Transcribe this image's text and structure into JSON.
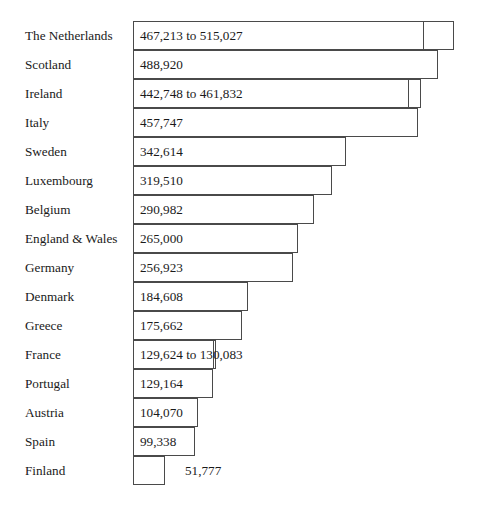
{
  "chart_data": {
    "type": "bar",
    "title": "",
    "subtitle": "",
    "xlabel": "",
    "ylabel": "",
    "orientation": "horizontal",
    "grid": false,
    "legend": null,
    "axis_visible": false,
    "xlim": [
      0,
      515027
    ],
    "categories": [
      "The Netherlands",
      "Scotland",
      "Ireland",
      "Italy",
      "Sweden",
      "Luxembourg",
      "Belgium",
      "England & Wales",
      "Germany",
      "Denmark",
      "Greece",
      "France",
      "Portugal",
      "Austria",
      "Spain",
      "Finland"
    ],
    "values": [
      467213,
      488920,
      442748,
      457747,
      342614,
      319510,
      290982,
      265000,
      256923,
      184608,
      175662,
      129624,
      129164,
      104070,
      99338,
      51777
    ],
    "value_upper": [
      515027,
      null,
      461832,
      null,
      null,
      null,
      null,
      null,
      null,
      null,
      null,
      130083,
      null,
      null,
      null,
      null
    ],
    "data_labels": [
      "467,213 to 515,027",
      "488,920",
      "442,748 to 461,832",
      "457,747",
      "342,614",
      "319,510",
      "290,982",
      "265,000",
      "256,923",
      "184,608",
      "175,662",
      "129,624 to 130,083",
      "129,164",
      "104,070",
      "99,338",
      "51,777"
    ],
    "label_placement": [
      "inside",
      "inside",
      "inside",
      "inside",
      "inside",
      "inside",
      "inside",
      "inside",
      "inside",
      "inside",
      "inside",
      "inside",
      "inside",
      "inside",
      "inside",
      "outside"
    ],
    "colors": {
      "bar_fill": "#ffffff",
      "bar_border": "#4a4a4a",
      "text": "#1a1a1a",
      "background": "#ffffff"
    }
  },
  "layout": {
    "bar_origin_x": 133,
    "row_height": 29,
    "first_row_top": 21,
    "px_per_unit": 0.000623,
    "outside_label_gap": 20
  }
}
